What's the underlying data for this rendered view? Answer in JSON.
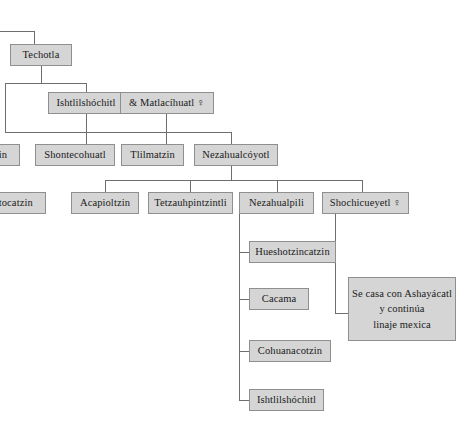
{
  "diagram": {
    "type": "family-tree",
    "width": 476,
    "height": 442,
    "colors": {
      "node_fill": "#d5d5d5",
      "node_border": "#8f8f8f",
      "edge": "#6e6e6e",
      "background": "#ffffff",
      "text": "#1a1a1a"
    },
    "generations": [
      {
        "level": 1,
        "nodes": [
          {
            "id": "techotla",
            "label": "Techotla",
            "x": 10,
            "y": 44,
            "w": 62,
            "h": 22
          }
        ]
      },
      {
        "level": 2,
        "nodes": [
          {
            "id": "ishtlilshochitl",
            "label": "Ishtlilshóchitl",
            "x": 48,
            "y": 92,
            "w": 76,
            "h": 22
          },
          {
            "id": "matlacihuatl",
            "label": "& Matlacíhuatl ♀",
            "x": 120,
            "y": 92,
            "w": 94,
            "h": 22
          }
        ]
      },
      {
        "level": 3,
        "nodes": [
          {
            "id": "tzin",
            "label": "tzin",
            "x": -22,
            "y": 144,
            "w": 42,
            "h": 22
          },
          {
            "id": "shontecohuatl",
            "label": "Shontecohuatl",
            "x": 35,
            "y": 144,
            "w": 80,
            "h": 22
          },
          {
            "id": "tlilmatzin",
            "label": "Tlilmatzin",
            "x": 121,
            "y": 144,
            "w": 63,
            "h": 22
          },
          {
            "id": "nezahualcoyotl",
            "label": "Nezahualcóyotl",
            "x": 194,
            "y": 144,
            "w": 84,
            "h": 22
          }
        ]
      },
      {
        "level": 4,
        "nodes": [
          {
            "id": "catocatzin",
            "label": "catocatzin",
            "x": -24,
            "y": 192,
            "w": 70,
            "h": 22
          },
          {
            "id": "acapioltzin",
            "label": "Acapioltzin",
            "x": 71,
            "y": 192,
            "w": 68,
            "h": 22
          },
          {
            "id": "tetzauhpintzintli",
            "label": "Tetzauhpintzintli",
            "x": 148,
            "y": 192,
            "w": 85,
            "h": 22
          },
          {
            "id": "nezahualpili",
            "label": "Nezahualpili",
            "x": 239,
            "y": 192,
            "w": 75,
            "h": 22
          },
          {
            "id": "shochicueyetl",
            "label": "Shochicueyetl ♀",
            "x": 322,
            "y": 192,
            "w": 87,
            "h": 22
          }
        ]
      },
      {
        "level": 5,
        "nodes": [
          {
            "id": "hueshotzincatzin",
            "label": "Hueshotzincatzin",
            "x": 249,
            "y": 241,
            "w": 87,
            "h": 22
          },
          {
            "id": "cacama",
            "label": "Cacama",
            "x": 249,
            "y": 288,
            "w": 60,
            "h": 22
          },
          {
            "id": "cohuanacotzin",
            "label": "Cohuanacotzin",
            "x": 249,
            "y": 340,
            "w": 82,
            "h": 22
          },
          {
            "id": "ishtlilshochitl2",
            "label": "Ishtlilshóchitl",
            "x": 249,
            "y": 389,
            "w": 75,
            "h": 22
          }
        ]
      }
    ],
    "annotation": {
      "id": "annotation-mexica",
      "lines": [
        "Se casa con Ashayácatl",
        "y continúa",
        "linaje mexica"
      ],
      "x": 348,
      "y": 277,
      "w": 108,
      "h": 64
    },
    "edges": [
      {
        "id": "top-stub-h",
        "orient": "h",
        "x": 0,
        "y": 31,
        "len": 34
      },
      {
        "id": "top-stub-v",
        "orient": "v",
        "x": 34,
        "y": 31,
        "len": 13
      },
      {
        "id": "techotla-down",
        "orient": "v",
        "x": 41,
        "y": 66,
        "len": 17
      },
      {
        "id": "gen2-bus",
        "orient": "h",
        "x": 5,
        "y": 83,
        "len": 81
      },
      {
        "id": "gen2-bus-left-down",
        "orient": "v",
        "x": 5,
        "y": 83,
        "len": 49
      },
      {
        "id": "ishtlilshochitl-up",
        "orient": "v",
        "x": 86,
        "y": 83,
        "len": 9
      },
      {
        "id": "ishtlilshochitl-down",
        "orient": "v",
        "x": 86,
        "y": 114,
        "len": 18
      },
      {
        "id": "matlacihuatl-down",
        "orient": "v",
        "x": 166,
        "y": 114,
        "len": 18
      },
      {
        "id": "gen3-bus",
        "orient": "h",
        "x": 5,
        "y": 132,
        "len": 227
      },
      {
        "id": "gen3-drop-shontecohuatl",
        "orient": "v",
        "x": 86,
        "y": 132,
        "len": 12
      },
      {
        "id": "gen3-drop-tlilmatzin",
        "orient": "v",
        "x": 166,
        "y": 132,
        "len": 12
      },
      {
        "id": "gen3-drop-nezahualcoyotl",
        "orient": "v",
        "x": 231,
        "y": 132,
        "len": 12
      },
      {
        "id": "nezahualcoyotl-down",
        "orient": "v",
        "x": 231,
        "y": 166,
        "len": 14
      },
      {
        "id": "gen4-bus",
        "orient": "h",
        "x": 105,
        "y": 180,
        "len": 257
      },
      {
        "id": "gen4-drop-acapioltzin",
        "orient": "v",
        "x": 105,
        "y": 180,
        "len": 12
      },
      {
        "id": "gen4-drop-tetzauhpintzintli",
        "orient": "v",
        "x": 190,
        "y": 180,
        "len": 12
      },
      {
        "id": "gen4-drop-nezahualpili",
        "orient": "v",
        "x": 277,
        "y": 180,
        "len": 12
      },
      {
        "id": "gen4-drop-shochicueyetl",
        "orient": "v",
        "x": 362,
        "y": 180,
        "len": 12
      },
      {
        "id": "nezahualpili-spine",
        "orient": "v",
        "x": 239,
        "y": 214,
        "len": 186
      },
      {
        "id": "child-stub-hueshotzincatzin",
        "orient": "h",
        "x": 239,
        "y": 252,
        "len": 11
      },
      {
        "id": "child-stub-cacama",
        "orient": "h",
        "x": 239,
        "y": 299,
        "len": 11
      },
      {
        "id": "child-stub-cohuanacotzin",
        "orient": "h",
        "x": 239,
        "y": 351,
        "len": 11
      },
      {
        "id": "child-stub-ishtlilshochitl",
        "orient": "h",
        "x": 239,
        "y": 400,
        "len": 11
      },
      {
        "id": "shochicueyetl-spine",
        "orient": "v",
        "x": 335,
        "y": 214,
        "len": 100
      },
      {
        "id": "shochicueyetl-to-annotation",
        "orient": "h",
        "x": 335,
        "y": 313,
        "len": 14
      }
    ]
  }
}
